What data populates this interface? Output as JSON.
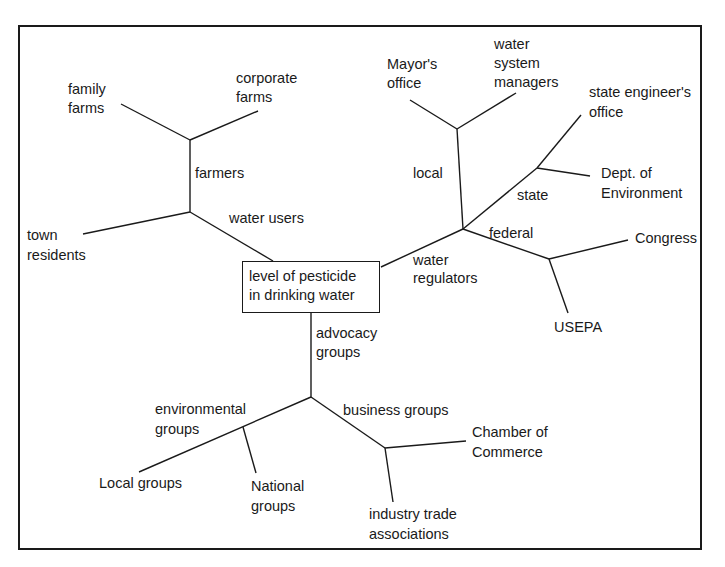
{
  "root": {
    "line1": "level of pesticide",
    "line2": "in drinking water"
  },
  "branches": {
    "water_users": {
      "label": "water users",
      "farmers": {
        "label": "farmers",
        "family_farms": {
          "l1": "family",
          "l2": "farms"
        },
        "corporate_farms": {
          "l1": "corporate",
          "l2": "farms"
        }
      },
      "town_residents": {
        "l1": "town",
        "l2": "residents"
      }
    },
    "water_regulators": {
      "l1": "water",
      "l2": "regulators",
      "local": {
        "label": "local",
        "mayors_office": {
          "l1": "Mayor's",
          "l2": "office"
        },
        "water_system_managers": {
          "l1": "water",
          "l2": "system",
          "l3": "managers"
        }
      },
      "state": {
        "label": "state",
        "state_engineers_office": {
          "l1": "state engineer's",
          "l2": "office"
        },
        "dept_environment": {
          "l1": "Dept. of",
          "l2": "Environment"
        }
      },
      "federal": {
        "label": "federal",
        "congress": "Congress",
        "usepa": "USEPA"
      }
    },
    "advocacy_groups": {
      "l1": "advocacy",
      "l2": "groups",
      "environmental": {
        "l1": "environmental",
        "l2": "groups",
        "local_groups": "Local groups",
        "national_groups": {
          "l1": "National",
          "l2": "groups"
        }
      },
      "business": {
        "label": "business groups",
        "chamber": {
          "l1": "Chamber of",
          "l2": "Commerce"
        },
        "industry": {
          "l1": "industry trade",
          "l2": "associations"
        }
      }
    }
  },
  "colors": {
    "line": "#1a1a1a",
    "background": "#ffffff"
  }
}
